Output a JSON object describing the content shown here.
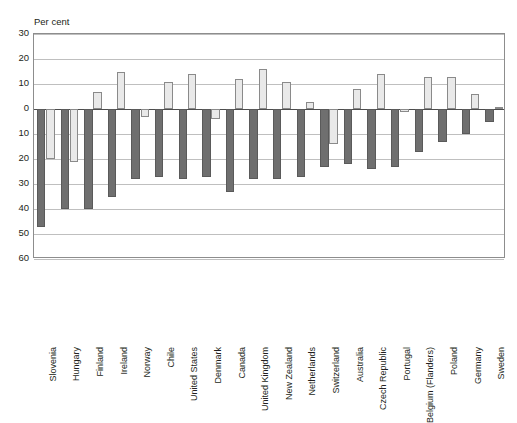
{
  "chart_data": {
    "type": "bar",
    "title": "",
    "xlabel": "",
    "ylabel": "Per cent",
    "ylim": [
      -60,
      30
    ],
    "yticks": [
      30,
      20,
      10,
      0,
      10,
      20,
      30,
      40,
      50,
      60
    ],
    "ytick_values": [
      30,
      20,
      10,
      0,
      -10,
      -20,
      -30,
      -40,
      -50,
      -60
    ],
    "grid": true,
    "legend": "none",
    "categories": [
      "Slovenia",
      "Hungary",
      "Finland",
      "Ireland",
      "Norway",
      "Chile",
      "United States",
      "Denmark",
      "Canada",
      "United Kingdom",
      "New Zealand",
      "Netherlands",
      "Switzerland",
      "Australia",
      "Czech Republic",
      "Portugal",
      "Belgium (Flanders)",
      "Poland",
      "Germany",
      "Sweden"
    ],
    "series": [
      {
        "name": "dark-series",
        "color": "#6f6f6f",
        "values": [
          -47,
          -40,
          -40,
          -35,
          -28,
          -27,
          -28,
          -27,
          -33,
          -28,
          -28,
          -27,
          -23,
          -22,
          -24,
          -23,
          -17,
          -13,
          -10,
          -5
        ]
      },
      {
        "name": "light-series",
        "color": "#e9e9e9",
        "values": [
          -20,
          -21,
          7,
          15,
          -3,
          11,
          14,
          -4,
          12,
          16,
          11,
          3,
          -14,
          8,
          14,
          -1,
          13,
          13,
          6,
          1
        ]
      }
    ]
  }
}
